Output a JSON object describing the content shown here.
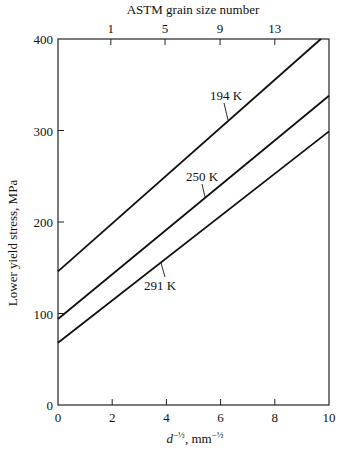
{
  "chart_data": {
    "type": "line",
    "title": "",
    "top_axis_label": "ASTM grain size number",
    "top_ticks": [
      {
        "label": "1",
        "x": 1.95
      },
      {
        "label": "5",
        "x": 3.95
      },
      {
        "label": "9",
        "x": 5.98
      },
      {
        "label": "13",
        "x": 8.0
      }
    ],
    "xlabel": "d^-1/2, mm^-1/2",
    "xlabel_main": "d",
    "xlabel_sup": "−½",
    "xlabel_unit": "mm",
    "xlabel_unit_sup": "−½",
    "ylabel": "Lower yield stress, MPa",
    "xlim": [
      0,
      10
    ],
    "ylim": [
      0,
      400
    ],
    "xticks": [
      0,
      2,
      4,
      6,
      8,
      10
    ],
    "yticks": [
      0,
      100,
      200,
      300,
      400
    ],
    "grid": false,
    "legend": "inline labels",
    "series": [
      {
        "name": "194 K",
        "x": [
          0,
          9.7
        ],
        "values": [
          146,
          400
        ],
        "slope": 26.2
      },
      {
        "name": "250 K",
        "x": [
          0,
          10
        ],
        "values": [
          94,
          338
        ],
        "slope": 24.4
      },
      {
        "name": "291 K",
        "x": [
          0,
          10
        ],
        "values": [
          68,
          299
        ],
        "slope": 23.1
      }
    ]
  }
}
